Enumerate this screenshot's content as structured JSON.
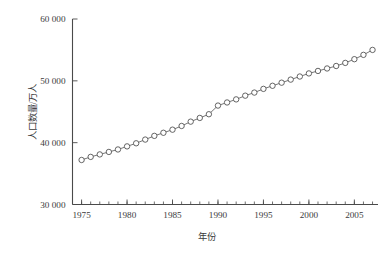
{
  "chart_data": {
    "type": "line",
    "title": "",
    "subtitle": "",
    "xlabel": "年份",
    "ylabel": "人口数量/万人",
    "xlim": [
      1974,
      2007.6
    ],
    "ylim": [
      30000,
      60000
    ],
    "grid": false,
    "legend": false,
    "legend_position": "none",
    "marker": "open-circle",
    "x_major_ticks": [
      1975,
      1980,
      1985,
      1990,
      1995,
      2000,
      2005
    ],
    "x_major_tick_labels": [
      "1975",
      "1980",
      "1985",
      "1990",
      "1995",
      "2000",
      "2005"
    ],
    "x_minor_tick_step": 1,
    "y_ticks": [
      30000,
      40000,
      50000,
      60000
    ],
    "y_tick_labels": [
      "30 000",
      "40 000",
      "50 000",
      "60 000"
    ],
    "series": [
      {
        "name": "人口数量",
        "color": "#4a4a4a",
        "x": [
          1975,
          1976,
          1977,
          1978,
          1979,
          1980,
          1981,
          1982,
          1983,
          1984,
          1985,
          1986,
          1987,
          1988,
          1989,
          1990,
          1991,
          1992,
          1993,
          1994,
          1995,
          1996,
          1997,
          1998,
          1999,
          2000,
          2001,
          2002,
          2003,
          2004,
          2005,
          2006,
          2007
        ],
        "values": [
          37200,
          37700,
          38100,
          38500,
          38900,
          39400,
          39900,
          40500,
          41100,
          41600,
          42100,
          42700,
          43400,
          44000,
          44600,
          46000,
          46500,
          47000,
          47600,
          48100,
          48700,
          49200,
          49700,
          50200,
          50700,
          51200,
          51600,
          52000,
          52400,
          52900,
          53500,
          54200,
          55000
        ]
      }
    ],
    "annotations": []
  },
  "axes": {
    "x_axis_name": "x-axis",
    "y_axis_name": "y-axis"
  }
}
